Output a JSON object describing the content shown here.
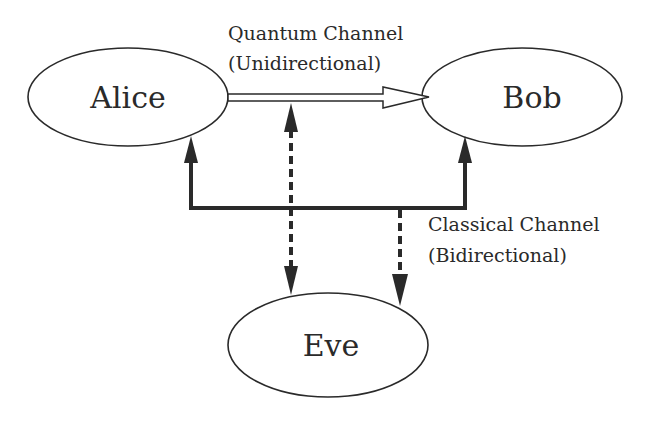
{
  "nodes": {
    "alice": {
      "label": "Alice",
      "cx": 128,
      "cy": 97,
      "rx": 100,
      "ry": 49
    },
    "bob": {
      "label": "Bob",
      "cx": 522,
      "cy": 97,
      "rx": 100,
      "ry": 49
    },
    "eve": {
      "label": "Eve",
      "cx": 328,
      "cy": 345,
      "rx": 100,
      "ry": 52
    }
  },
  "channels": {
    "quantum": {
      "title": "Quantum Channel",
      "subtitle": "(Unidirectional)",
      "direction": "Alice → Bob"
    },
    "classical": {
      "title": "Classical Channel",
      "subtitle": "(Bidirectional)",
      "direction": "Alice ↔ Bob"
    }
  },
  "eavesdrop_links": [
    {
      "from": "quantum",
      "to": "eve",
      "style": "dashed",
      "bidirectional": true
    },
    {
      "from": "classical",
      "to": "eve",
      "style": "dashed",
      "bidirectional": false
    }
  ],
  "colors": {
    "stroke": "#2a2a2a",
    "background": "#ffffff"
  }
}
